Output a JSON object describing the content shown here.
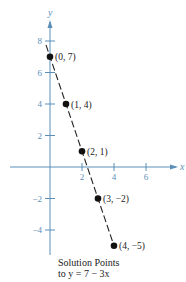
{
  "chart_data": {
    "type": "scatter",
    "title": "Solution Points to y = 7 − 3x",
    "xlabel": "x",
    "ylabel": "y",
    "x": [
      0,
      1,
      2,
      3,
      4
    ],
    "y": [
      7,
      4,
      1,
      -2,
      -5
    ],
    "point_labels": [
      "(0, 7)",
      "(1, 4)",
      "(2, 1)",
      "(3, −2)",
      "(4, −5)"
    ],
    "line": {
      "equation": "y = 7 − 3x",
      "style": "dashed"
    },
    "x_ticks": [
      2,
      4,
      6
    ],
    "y_ticks": [
      8,
      6,
      4,
      2,
      -2,
      -4
    ],
    "xlim": [
      -2.5,
      7.8
    ],
    "ylim": [
      -5.5,
      9.3
    ],
    "grid": false,
    "legend": null
  },
  "caption": {
    "line1": "Solution Points",
    "line2": "to y = 7 − 3x"
  },
  "colors": {
    "axis": "#5b8fb8",
    "points": "#111111",
    "text": "#222222"
  }
}
